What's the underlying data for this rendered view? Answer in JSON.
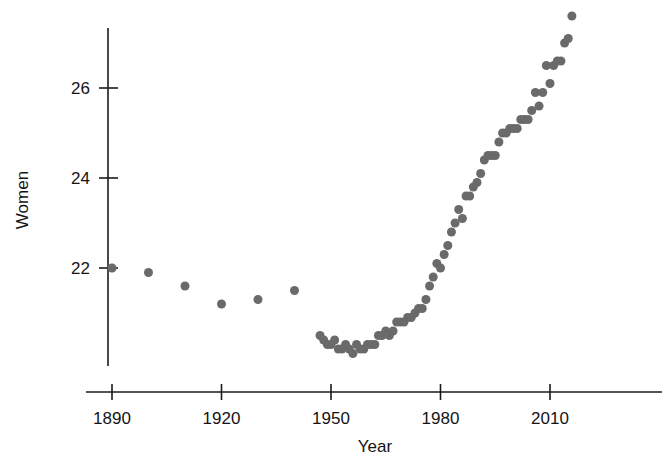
{
  "chart_data": {
    "type": "scatter",
    "title": "",
    "xlabel": "Year",
    "ylabel": "Women",
    "xlim": [
      1884,
      2019
    ],
    "ylim": [
      19.9,
      27.9
    ],
    "grid": false,
    "legend": null,
    "marker": {
      "shape": "circle",
      "color": "#6a6a6a",
      "size": 9
    },
    "x_ticks": [
      1890,
      1920,
      1950,
      1980,
      2010
    ],
    "x_tick_labels": [
      "1890",
      "1920",
      "1950",
      "1980",
      "2010"
    ],
    "y_ticks": [
      22,
      24,
      26
    ],
    "y_tick_labels": [
      "22",
      "24",
      "26"
    ],
    "series": [
      {
        "name": "Women",
        "points": [
          [
            1890,
            22.0
          ],
          [
            1900,
            21.9
          ],
          [
            1910,
            21.6
          ],
          [
            1920,
            21.2
          ],
          [
            1930,
            21.3
          ],
          [
            1940,
            21.5
          ],
          [
            1947,
            20.5
          ],
          [
            1948,
            20.4
          ],
          [
            1949,
            20.3
          ],
          [
            1950,
            20.3
          ],
          [
            1951,
            20.4
          ],
          [
            1952,
            20.2
          ],
          [
            1953,
            20.2
          ],
          [
            1954,
            20.3
          ],
          [
            1955,
            20.2
          ],
          [
            1956,
            20.1
          ],
          [
            1957,
            20.3
          ],
          [
            1958,
            20.2
          ],
          [
            1959,
            20.2
          ],
          [
            1960,
            20.3
          ],
          [
            1961,
            20.3
          ],
          [
            1962,
            20.3
          ],
          [
            1963,
            20.5
          ],
          [
            1964,
            20.5
          ],
          [
            1965,
            20.6
          ],
          [
            1966,
            20.5
          ],
          [
            1967,
            20.6
          ],
          [
            1968,
            20.8
          ],
          [
            1969,
            20.8
          ],
          [
            1970,
            20.8
          ],
          [
            1971,
            20.9
          ],
          [
            1972,
            20.9
          ],
          [
            1973,
            21.0
          ],
          [
            1974,
            21.1
          ],
          [
            1975,
            21.1
          ],
          [
            1976,
            21.3
          ],
          [
            1977,
            21.6
          ],
          [
            1978,
            21.8
          ],
          [
            1979,
            22.1
          ],
          [
            1980,
            22.0
          ],
          [
            1981,
            22.3
          ],
          [
            1982,
            22.5
          ],
          [
            1983,
            22.8
          ],
          [
            1984,
            23.0
          ],
          [
            1985,
            23.3
          ],
          [
            1986,
            23.1
          ],
          [
            1987,
            23.6
          ],
          [
            1988,
            23.6
          ],
          [
            1989,
            23.8
          ],
          [
            1990,
            23.9
          ],
          [
            1991,
            24.1
          ],
          [
            1992,
            24.4
          ],
          [
            1993,
            24.5
          ],
          [
            1994,
            24.5
          ],
          [
            1995,
            24.5
          ],
          [
            1996,
            24.8
          ],
          [
            1997,
            25.0
          ],
          [
            1998,
            25.0
          ],
          [
            1999,
            25.1
          ],
          [
            2000,
            25.1
          ],
          [
            2001,
            25.1
          ],
          [
            2002,
            25.3
          ],
          [
            2003,
            25.3
          ],
          [
            2004,
            25.3
          ],
          [
            2005,
            25.5
          ],
          [
            2006,
            25.9
          ],
          [
            2007,
            25.6
          ],
          [
            2008,
            25.9
          ],
          [
            2009,
            26.5
          ],
          [
            2010,
            26.1
          ],
          [
            2011,
            26.5
          ],
          [
            2012,
            26.6
          ],
          [
            2013,
            26.6
          ],
          [
            2014,
            27.0
          ],
          [
            2015,
            27.1
          ],
          [
            2016,
            27.6
          ]
        ]
      }
    ]
  },
  "axes": {
    "y_axis_title": "Women",
    "x_axis_title": "Year"
  }
}
